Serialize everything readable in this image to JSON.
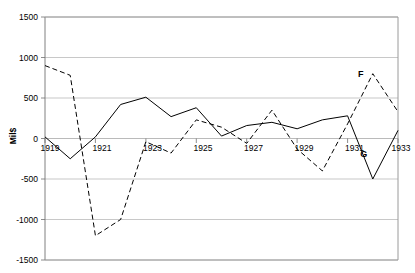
{
  "chart_data": {
    "type": "line",
    "title": "",
    "xlabel": "",
    "ylabel": "Mil$",
    "ylim": [
      -1500,
      1500
    ],
    "xlim": [
      1919,
      1933
    ],
    "grid": true,
    "legend": "none",
    "y_ticks": [
      1500,
      1000,
      500,
      0,
      -500,
      -1000,
      -1500
    ],
    "x_ticks": [
      1919,
      1921,
      1923,
      1925,
      1927,
      1929,
      1931,
      1933
    ],
    "x": [
      1919,
      1920,
      1921,
      1922,
      1923,
      1924,
      1925,
      1926,
      1927,
      1928,
      1929,
      1930,
      1931,
      1932,
      1933
    ],
    "series": [
      {
        "name": "solid-series",
        "style": "solid",
        "values": [
          20,
          -250,
          20,
          420,
          510,
          270,
          380,
          30,
          160,
          200,
          120,
          230,
          280,
          -500,
          100
        ]
      },
      {
        "name": "dashed-series",
        "style": "dashed",
        "values": [
          900,
          780,
          -1200,
          -1000,
          -40,
          -180,
          230,
          140,
          -60,
          350,
          -130,
          -400,
          180,
          800,
          330
        ]
      }
    ],
    "annotations": [
      {
        "label": "F",
        "x": 1932,
        "y": 800
      },
      {
        "label": "G",
        "x": 1932,
        "y": -500
      }
    ]
  }
}
